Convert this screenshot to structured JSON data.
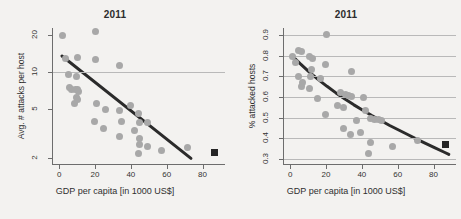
{
  "figure": {
    "background_color": "#f3f2f0",
    "point_color": "#a8a8a8",
    "fit_line_color": "#2b2b2b",
    "grid_color": "#b9b9b9",
    "axis_color": "#6d6d6d",
    "marker_color": "#252525"
  },
  "chart_data": [
    {
      "panel": "left",
      "type": "scatter",
      "title": "2011",
      "xlabel": "GDP per capita [in 1000 US$]",
      "ylabel": "Avg. # attacks per host",
      "xlim": [
        -4,
        92
      ],
      "ylim": [
        1.8,
        23
      ],
      "yscale": "log",
      "xticks": [
        0,
        20,
        40,
        60,
        80
      ],
      "yticks": [
        2,
        5,
        10,
        20
      ],
      "grid": "horizontal-at-10",
      "gridlines_y": [
        10
      ],
      "legend": null,
      "points": [
        {
          "x": 1.5,
          "y": 20.0
        },
        {
          "x": 19.5,
          "y": 21.5
        },
        {
          "x": 3.0,
          "y": 13.0
        },
        {
          "x": 9.5,
          "y": 13.2
        },
        {
          "x": 19.5,
          "y": 12.8
        },
        {
          "x": 33.0,
          "y": 11.5
        },
        {
          "x": 4.5,
          "y": 9.6
        },
        {
          "x": 9.0,
          "y": 9.2
        },
        {
          "x": 5.0,
          "y": 7.6
        },
        {
          "x": 6.5,
          "y": 7.3
        },
        {
          "x": 8.5,
          "y": 7.2
        },
        {
          "x": 9.5,
          "y": 7.2
        },
        {
          "x": 10.0,
          "y": 7.0
        },
        {
          "x": 9.0,
          "y": 6.3
        },
        {
          "x": 9.5,
          "y": 6.0
        },
        {
          "x": 8.0,
          "y": 5.6
        },
        {
          "x": 20.0,
          "y": 5.6
        },
        {
          "x": 39.5,
          "y": 5.4
        },
        {
          "x": 25.5,
          "y": 5.0
        },
        {
          "x": 33.0,
          "y": 4.9
        },
        {
          "x": 43.5,
          "y": 4.6
        },
        {
          "x": 19.0,
          "y": 4.0
        },
        {
          "x": 34.0,
          "y": 4.0
        },
        {
          "x": 44.0,
          "y": 3.9
        },
        {
          "x": 49.0,
          "y": 3.9
        },
        {
          "x": 24.0,
          "y": 3.5
        },
        {
          "x": 41.5,
          "y": 3.4
        },
        {
          "x": 33.0,
          "y": 3.0
        },
        {
          "x": 44.0,
          "y": 2.9
        },
        {
          "x": 44.5,
          "y": 2.6
        },
        {
          "x": 48.5,
          "y": 2.5
        },
        {
          "x": 43.5,
          "y": 2.2
        },
        {
          "x": 56.5,
          "y": 2.3
        },
        {
          "x": 71.0,
          "y": 2.45
        }
      ],
      "fit_line": {
        "x0": 1.0,
        "y0": 13.6,
        "x1": 73.0,
        "y1": 2.0
      },
      "highlight_marker": {
        "x": 86.0,
        "y": 2.25,
        "shape": "square"
      }
    },
    {
      "panel": "right",
      "type": "scatter",
      "title": "2011",
      "xlabel": "GDP per capita [in 1000 US$]",
      "ylabel": "% attacked hosts",
      "xlim": [
        -4,
        92
      ],
      "ylim": [
        0.275,
        0.935
      ],
      "yscale": "linear",
      "xticks": [
        0,
        20,
        40,
        60,
        80
      ],
      "yticks": [
        0.3,
        0.4,
        0.5,
        0.6,
        0.7,
        0.8,
        0.9
      ],
      "grid": "horizontal",
      "gridlines_y": [
        0.3,
        0.4,
        0.5,
        0.6,
        0.7,
        0.8,
        0.9
      ],
      "legend": null,
      "points": [
        {
          "x": 19.5,
          "y": 0.905
        },
        {
          "x": 4.0,
          "y": 0.825
        },
        {
          "x": 5.5,
          "y": 0.822
        },
        {
          "x": 1.0,
          "y": 0.795
        },
        {
          "x": 10.5,
          "y": 0.795
        },
        {
          "x": 12.0,
          "y": 0.787
        },
        {
          "x": 2.5,
          "y": 0.768
        },
        {
          "x": 19.0,
          "y": 0.757
        },
        {
          "x": 11.5,
          "y": 0.735
        },
        {
          "x": 33.5,
          "y": 0.725
        },
        {
          "x": 4.0,
          "y": 0.7
        },
        {
          "x": 11.0,
          "y": 0.702
        },
        {
          "x": 16.5,
          "y": 0.692
        },
        {
          "x": 6.5,
          "y": 0.672
        },
        {
          "x": 5.5,
          "y": 0.65
        },
        {
          "x": 10.0,
          "y": 0.64
        },
        {
          "x": 27.5,
          "y": 0.62
        },
        {
          "x": 30.5,
          "y": 0.612
        },
        {
          "x": 32.0,
          "y": 0.607
        },
        {
          "x": 33.5,
          "y": 0.605
        },
        {
          "x": 40.5,
          "y": 0.598
        },
        {
          "x": 14.5,
          "y": 0.592
        },
        {
          "x": 26.0,
          "y": 0.56
        },
        {
          "x": 29.0,
          "y": 0.548
        },
        {
          "x": 41.5,
          "y": 0.535
        },
        {
          "x": 19.0,
          "y": 0.515
        },
        {
          "x": 44.0,
          "y": 0.495
        },
        {
          "x": 46.5,
          "y": 0.492
        },
        {
          "x": 48.5,
          "y": 0.49
        },
        {
          "x": 50.5,
          "y": 0.488
        },
        {
          "x": 36.5,
          "y": 0.487
        },
        {
          "x": 29.0,
          "y": 0.445
        },
        {
          "x": 38.5,
          "y": 0.43
        },
        {
          "x": 33.0,
          "y": 0.418
        },
        {
          "x": 44.5,
          "y": 0.378
        },
        {
          "x": 56.5,
          "y": 0.362
        },
        {
          "x": 70.5,
          "y": 0.388
        },
        {
          "x": 43.0,
          "y": 0.328
        }
      ],
      "fit_curve": [
        {
          "x": 0.5,
          "y": 0.8
        },
        {
          "x": 5.0,
          "y": 0.762
        },
        {
          "x": 10.0,
          "y": 0.722
        },
        {
          "x": 15.0,
          "y": 0.686
        },
        {
          "x": 20.0,
          "y": 0.652
        },
        {
          "x": 25.0,
          "y": 0.62
        },
        {
          "x": 30.0,
          "y": 0.59
        },
        {
          "x": 35.0,
          "y": 0.562
        },
        {
          "x": 40.0,
          "y": 0.536
        },
        {
          "x": 45.0,
          "y": 0.51
        },
        {
          "x": 50.0,
          "y": 0.486
        },
        {
          "x": 55.0,
          "y": 0.462
        },
        {
          "x": 60.0,
          "y": 0.44
        },
        {
          "x": 65.0,
          "y": 0.418
        },
        {
          "x": 70.0,
          "y": 0.396
        },
        {
          "x": 75.0,
          "y": 0.375
        },
        {
          "x": 80.0,
          "y": 0.354
        },
        {
          "x": 85.5,
          "y": 0.332
        },
        {
          "x": 88.0,
          "y": 0.322
        }
      ],
      "highlight_marker": {
        "x": 86.0,
        "y": 0.368,
        "shape": "square"
      }
    }
  ]
}
